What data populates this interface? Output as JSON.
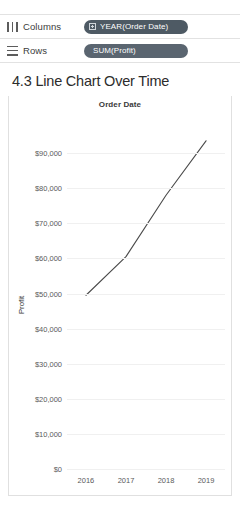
{
  "shelves": [
    {
      "label": "Columns",
      "icon": "columns-icon",
      "pill": {
        "text": "YEAR(Order Date)",
        "glyph": "calendar-plus-icon",
        "color": "#4e5a64"
      }
    },
    {
      "label": "Rows",
      "icon": "rows-icon",
      "pill": {
        "text": "SUM(Profit)",
        "glyph": "",
        "color": "#5a6570"
      }
    }
  ],
  "sheet": {
    "title": "4.3 Line Chart Over Time"
  },
  "chart_data": {
    "type": "line",
    "title": "Order Date",
    "xlabel": "",
    "ylabel": "Profit",
    "categories": [
      "2016",
      "2017",
      "2018",
      "2019"
    ],
    "values": [
      49500,
      60500,
      78000,
      93500
    ],
    "series": [
      {
        "name": "SUM(Profit)",
        "values": [
          49500,
          60500,
          78000,
          93500
        ],
        "color": "#4a4a4a"
      }
    ],
    "ylim": [
      0,
      100000
    ],
    "yticks": [
      0,
      10000,
      20000,
      30000,
      40000,
      50000,
      60000,
      70000,
      80000,
      90000
    ],
    "ytick_labels": [
      "$0",
      "$10,000",
      "$20,000",
      "$30,000",
      "$40,000",
      "$50,000",
      "$60,000",
      "$70,000",
      "$80,000",
      "$90,000"
    ],
    "grid": true,
    "legend": "none"
  }
}
